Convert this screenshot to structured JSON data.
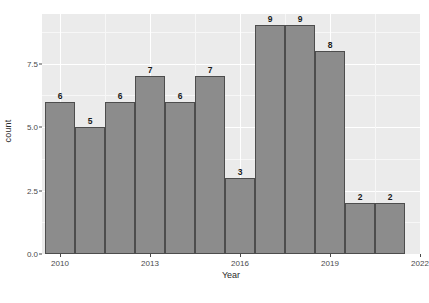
{
  "chart_data": {
    "type": "bar",
    "title": "",
    "subtitle": "",
    "xlabel": "Year",
    "ylabel": "count",
    "categories": [
      2010,
      2011,
      2012,
      2013,
      2014,
      2015,
      2016,
      2017,
      2018,
      2019,
      2020,
      2021
    ],
    "values": [
      6,
      5,
      6,
      7,
      6,
      7,
      3,
      9,
      9,
      8,
      2,
      2
    ],
    "data_labels": [
      "6",
      "5",
      "6",
      "7",
      "6",
      "7",
      "3",
      "9",
      "9",
      "8",
      "2",
      "2"
    ],
    "ylim": [
      0,
      9.45
    ],
    "xlim": [
      2009.4,
      2022.0
    ],
    "y_ticks": [
      0.0,
      2.5,
      5.0,
      7.5
    ],
    "y_tick_labels": [
      "0.0",
      "2.5",
      "5.0",
      "7.5"
    ],
    "y_minor_ticks": [
      1.25,
      3.75,
      6.25,
      8.75
    ],
    "x_ticks": [
      2010,
      2013,
      2016,
      2019,
      2022
    ],
    "x_tick_labels": [
      "2010",
      "2013",
      "2016",
      "2019",
      "2022"
    ],
    "x_minor_ticks": [
      2011.5,
      2014.5,
      2017.5,
      2020.5
    ],
    "grid": true,
    "legend": "none",
    "bar_fill": "#8c8c8c",
    "bar_border": "#4d4d4d",
    "panel_background": "#ebebeb",
    "gridline_color": "#ffffff"
  },
  "caption": {
    "text": ""
  }
}
